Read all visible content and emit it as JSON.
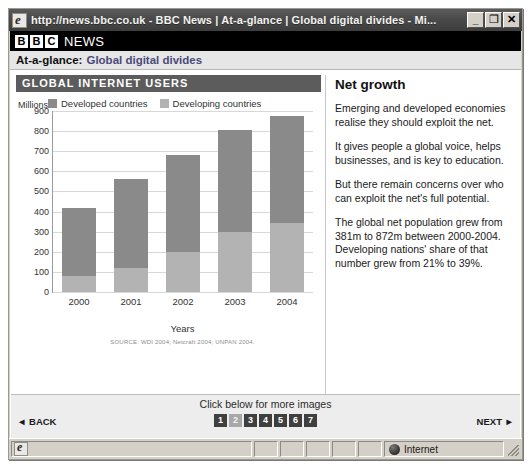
{
  "window": {
    "title": "http://news.bbc.co.uk - BBC News | At-a-glance | Global digital divides - Mi...",
    "minimize_label": "_",
    "maximize_label": "❐",
    "close_label": "✕",
    "browser_icon": "ie-logo-icon"
  },
  "brand": {
    "letters": [
      "B",
      "B",
      "C"
    ],
    "news_word": "NEWS"
  },
  "glance": {
    "prefix": "At-a-glance:",
    "title": "Global digital divides"
  },
  "chart_panel": {
    "heading": "GLOBAL INTERNET USERS"
  },
  "right_panel": {
    "title": "Net growth",
    "paragraphs": [
      "Emerging and developed economies realise they should exploit the net.",
      "It gives people a global voice, helps businesses, and is key to education.",
      "But there remain concerns over who can exploit the net's full potential.",
      "The global net population grew from 381m to 872m between 2000-2004. Developing nations' share of that number grew from 21% to 39%."
    ]
  },
  "bottom_nav": {
    "more_images_label": "Click below for more images",
    "back_label": "◄ BACK",
    "next_label": "NEXT ►",
    "pages": [
      "1",
      "2",
      "3",
      "4",
      "5",
      "6",
      "7"
    ],
    "active_page": "2"
  },
  "status_bar": {
    "zone_label": "Internet",
    "zone_icon": "globe-icon",
    "document_icon": "ie-logo-icon",
    "resize_grip": "resize-grip-icon"
  },
  "chart_data": {
    "type": "bar",
    "subtype": "stacked",
    "title": "GLOBAL INTERNET USERS",
    "xlabel": "Years",
    "ylabel": "Millions",
    "ylim": [
      0,
      900
    ],
    "yticks": [
      900,
      800,
      700,
      600,
      500,
      400,
      300,
      200,
      100,
      0
    ],
    "grid": true,
    "legend_position": "top",
    "categories": [
      "2000",
      "2001",
      "2002",
      "2003",
      "2004"
    ],
    "series": [
      {
        "name": "Developed countries",
        "color": "#8a8a8a",
        "values": [
          340,
          440,
          480,
          505,
          530
        ]
      },
      {
        "name": "Developing countries",
        "color": "#b3b3b3",
        "values": [
          80,
          120,
          200,
          300,
          345
        ]
      }
    ],
    "totals": [
      420,
      560,
      680,
      805,
      875
    ],
    "source": "SOURCE: WDI 2004; Netcraft 2004; UNPAN 2004."
  }
}
